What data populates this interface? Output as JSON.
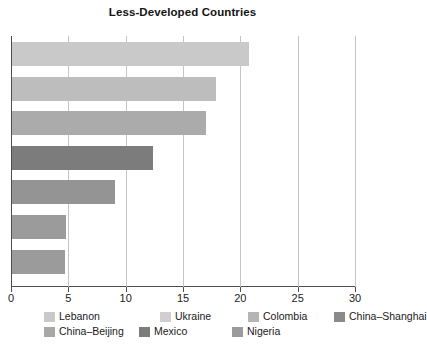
{
  "chart_data": {
    "type": "bar",
    "orientation": "horizontal",
    "title": "Less-Developed Countries",
    "xlabel": "",
    "ylabel": "",
    "xlim": [
      0,
      30
    ],
    "xticks": [
      0,
      5,
      10,
      15,
      20,
      25,
      30
    ],
    "xticklabels": [
      "0",
      "5",
      "10",
      "15",
      "20",
      "25",
      "30"
    ],
    "grid": "vertical",
    "legend_position": "bottom",
    "categories": [
      "Lebanon",
      "Ukraine",
      "Colombia",
      "China–Shanghai",
      "China–Beijing",
      "Mexico",
      "Nigeria"
    ],
    "values": [
      20.7,
      17.8,
      16.9,
      12.3,
      9.0,
      4.7,
      4.6
    ],
    "colors": [
      "#c9c9c9",
      "#bdbdbd",
      "#ababab",
      "#7c7c7c",
      "#949494",
      "#9b9b9b",
      "#9b9b9b"
    ],
    "bars": [
      {
        "label": "Lebanon",
        "value": 20.7,
        "color": "#c9c9c9"
      },
      {
        "label": "Ukraine",
        "value": 17.8,
        "color": "#bdbdbd"
      },
      {
        "label": "Colombia",
        "value": 16.9,
        "color": "#ababab"
      },
      {
        "label": "China–Shanghai",
        "value": 12.3,
        "color": "#7c7c7c"
      },
      {
        "label": "China–Beijing",
        "value": 9.0,
        "color": "#949494"
      },
      {
        "label": "Mexico",
        "value": 4.7,
        "color": "#9b9b9b"
      },
      {
        "label": "Nigeria",
        "value": 4.6,
        "color": "#9b9b9b"
      }
    ],
    "legend": [
      {
        "label": "Lebanon",
        "color": "#c9c9c9",
        "row": 0,
        "col": 0
      },
      {
        "label": "Ukraine",
        "color": "#cfcfcf",
        "row": 0,
        "col": 1
      },
      {
        "label": "Colombia",
        "color": "#b5b5b5",
        "row": 0,
        "col": 2
      },
      {
        "label": "China–Shanghai",
        "color": "#8a8a8a",
        "row": 0,
        "col": 3
      },
      {
        "label": "China–Beijing",
        "color": "#a8a8a8",
        "row": 1,
        "col": 0
      },
      {
        "label": "Mexico",
        "color": "#7c7c7c",
        "row": 1,
        "col": 1
      },
      {
        "label": "Nigeria",
        "color": "#9b9b9b",
        "row": 1,
        "col": 2
      }
    ]
  }
}
